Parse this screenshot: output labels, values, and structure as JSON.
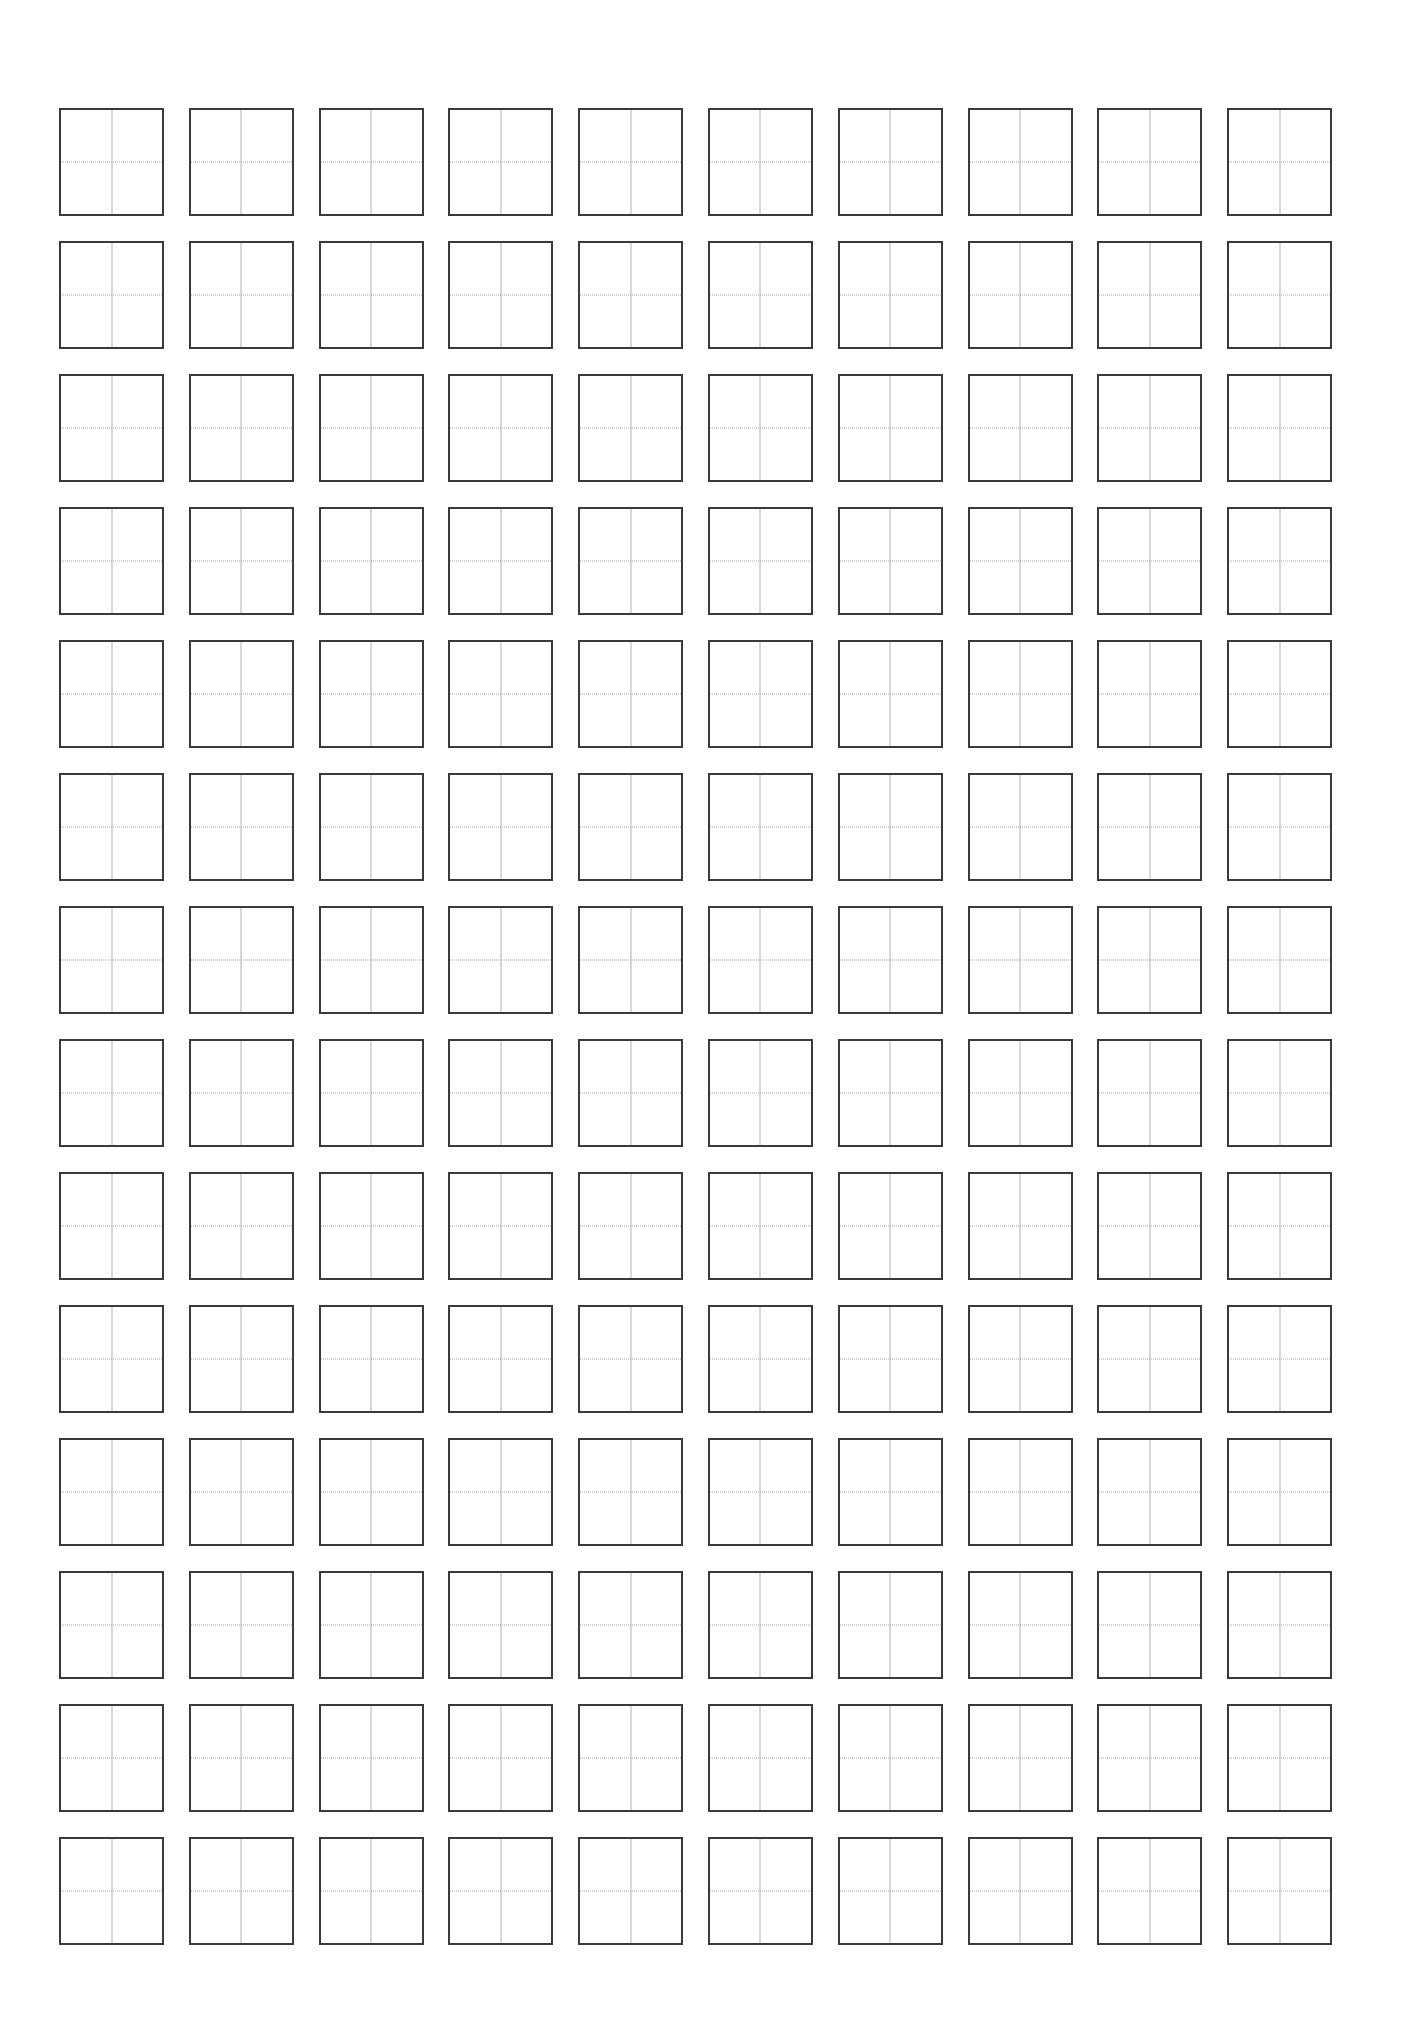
{
  "page": {
    "type": "tianzige-practice-sheet",
    "background_color": "#ffffff",
    "border_color": "#3a3a3a",
    "guide_vertical_color": "#b4b4b4",
    "guide_horizontal_color": "#a8a8a8"
  },
  "grid": {
    "rows": 14,
    "columns": 10,
    "cells_total": 140,
    "cell_guides": [
      "vertical-center-solid",
      "horizontal-center-dotted"
    ]
  }
}
